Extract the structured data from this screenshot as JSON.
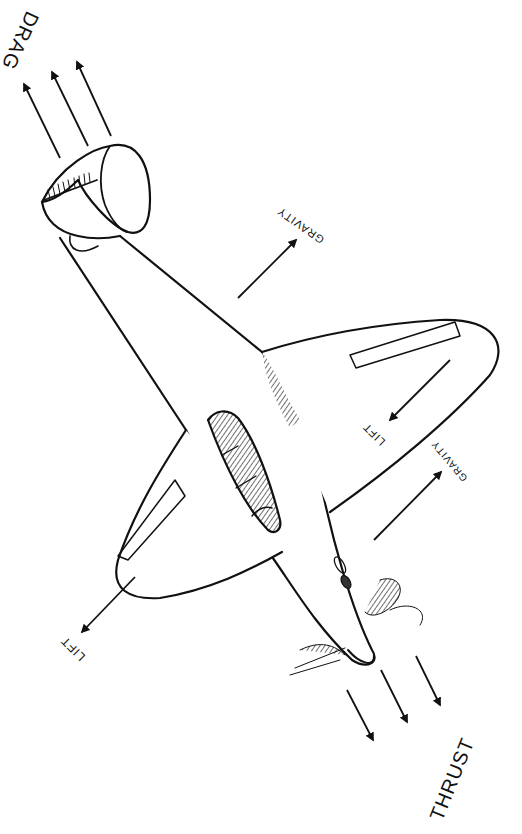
{
  "diagram": {
    "background": "#ffffff",
    "ink": "#111111",
    "forces": [
      {
        "id": "drag",
        "label": "DRAG",
        "arrows": 3,
        "direction": "up-left, away from tail"
      },
      {
        "id": "thrust",
        "label": "THRUST",
        "arrows": 3,
        "direction": "down-right, ahead of nose"
      },
      {
        "id": "lift-left",
        "label": "LIFT",
        "arrows": 1,
        "direction": "down-left from left wing"
      },
      {
        "id": "lift-right",
        "label": "LIFT",
        "arrows": 1,
        "direction": "down-left on right wing"
      },
      {
        "id": "gravity-upper",
        "label": "GRAVITY",
        "arrows": 1,
        "direction": "up-right from fuselage"
      },
      {
        "id": "gravity-lower",
        "label": "GRAVITY",
        "arrows": 1,
        "direction": "up-right below right wing"
      }
    ]
  },
  "labels": {
    "drag": "DRAG",
    "thrust": "THRUST",
    "lift_left": "LIFT",
    "lift_right": "LIFT",
    "gravity_upper": "GRAVITY",
    "gravity_lower": "GRAVITY"
  }
}
